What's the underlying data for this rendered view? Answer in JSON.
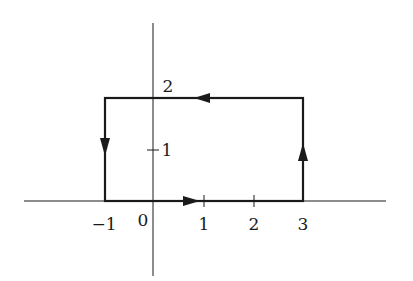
{
  "diagram": {
    "type": "rectangular contour on coordinate axes",
    "axes": {
      "x_ticks": [
        {
          "value": -1,
          "label": "−1"
        },
        {
          "value": 0,
          "label": "0"
        },
        {
          "value": 1,
          "label": "1"
        },
        {
          "value": 2,
          "label": "2"
        },
        {
          "value": 3,
          "label": "3"
        }
      ],
      "y_ticks": [
        {
          "value": 1,
          "label": "1"
        },
        {
          "value": 2,
          "label": "2"
        }
      ]
    },
    "contour": {
      "vertices": [
        [
          -1,
          0
        ],
        [
          3,
          0
        ],
        [
          3,
          2
        ],
        [
          -1,
          2
        ]
      ],
      "orientation": "counterclockwise",
      "arrows": [
        {
          "segment": "bottom",
          "direction": "right"
        },
        {
          "segment": "right",
          "direction": "up"
        },
        {
          "segment": "top",
          "direction": "left"
        },
        {
          "segment": "left",
          "direction": "down"
        }
      ]
    },
    "colors": {
      "line": "#1a1a1a",
      "background": "#ffffff"
    }
  }
}
